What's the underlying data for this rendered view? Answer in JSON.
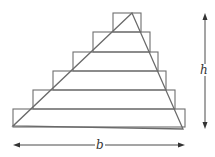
{
  "figure": {
    "labels": {
      "height": "h",
      "base": "b"
    },
    "colors": {
      "lines": "#6e6e6e",
      "arrows": "#333333",
      "background": "#ffffff"
    },
    "steps": [
      {
        "x": 113,
        "y": 13,
        "w": 28,
        "h": 19
      },
      {
        "x": 93,
        "y": 32,
        "w": 57,
        "h": 20
      },
      {
        "x": 73,
        "y": 52,
        "w": 85,
        "h": 19
      },
      {
        "x": 53,
        "y": 71,
        "w": 113,
        "h": 19
      },
      {
        "x": 33,
        "y": 90,
        "w": 142,
        "h": 19
      },
      {
        "x": 13,
        "y": 109,
        "w": 172,
        "h": 18
      }
    ],
    "triangle": {
      "apex": [
        132,
        13
      ],
      "bottom_left": [
        13,
        126
      ],
      "bottom_right": [
        183,
        129
      ]
    },
    "height_arrow": {
      "x": 205,
      "y1": 14,
      "y2": 128
    },
    "base_arrow": {
      "y": 145,
      "x1": 13,
      "x2": 185
    }
  }
}
